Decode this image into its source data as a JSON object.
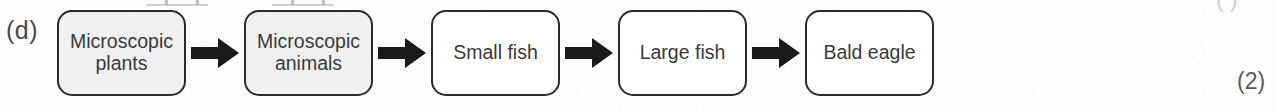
{
  "figure": {
    "part_label": "(d)",
    "marks": {
      "bottom_right": "(2)",
      "top_right_fragment": "( )"
    }
  },
  "chain_data": {
    "type": "diagram",
    "diagram_kind": "food-chain-flow",
    "direction": "left-to-right",
    "node_count": 5,
    "arrow_count": 4,
    "arrow_glyph": "block-arrow-right",
    "nodes": [
      {
        "label": "Microscopic plants",
        "lines": [
          "Microscopic",
          "plants"
        ],
        "fill": "shaded",
        "fill_color": "#f0f0f0"
      },
      {
        "label": "Microscopic animals",
        "lines": [
          "Microscopic",
          "animals"
        ],
        "fill": "shaded",
        "fill_color": "#f0f0f0"
      },
      {
        "label": "Small fish",
        "lines": [
          "Small fish"
        ],
        "fill": "white",
        "fill_color": "#ffffff"
      },
      {
        "label": "Large fish",
        "lines": [
          "Large fish"
        ],
        "fill": "white",
        "fill_color": "#ffffff"
      },
      {
        "label": "Bald eagle",
        "lines": [
          "Bald eagle"
        ],
        "fill": "white",
        "fill_color": "#ffffff"
      }
    ],
    "colors": {
      "border": "#2b2b2b",
      "text": "#3a3a3a",
      "arrow": "#1a1a1a",
      "background": "#fdfdfd"
    }
  }
}
